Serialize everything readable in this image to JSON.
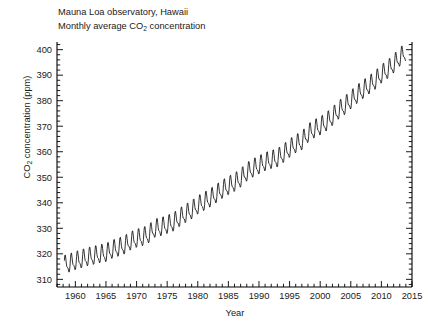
{
  "chart_data": {
    "type": "line",
    "title": "Mauna Loa observatory, Hawaii",
    "subtitle": "Monthly average CO2 concentration",
    "title_lines": [
      "Mauna Loa observatory, Hawaii",
      "Monthly average CO",
      " concentration"
    ],
    "xlabel": "Year",
    "ylabel": "CO2 concentration (ppm)",
    "ylabel_prefix": "CO",
    "ylabel_sub": "2",
    "ylabel_suffix": " concentration (ppm)",
    "xlim": [
      1957.0,
      2015.0
    ],
    "ylim": [
      307.0,
      403.0
    ],
    "xticks": [
      1960,
      1965,
      1970,
      1975,
      1980,
      1985,
      1990,
      1995,
      2000,
      2005,
      2010,
      2015
    ],
    "xtick_labels": [
      "1960",
      "1965",
      "1970",
      "1975",
      "1980",
      "1985",
      "1990",
      "1995",
      "2000",
      "2005",
      "2010",
      "2015"
    ],
    "x_minor_step": 1,
    "yticks": [
      310,
      320,
      330,
      340,
      350,
      360,
      370,
      380,
      390,
      400
    ],
    "ytick_labels": [
      "310",
      "320",
      "330",
      "340",
      "350",
      "360",
      "370",
      "380",
      "390",
      "400"
    ],
    "y_minor_step": 2,
    "grid": false,
    "legend": null,
    "line_color": "#000000",
    "line_width": 0.8,
    "spines": [
      "left",
      "bottom",
      "right"
    ],
    "tick_direction": "in",
    "series_name": "Monthly average CO2 concentration",
    "series_units": "ppm",
    "data_start_year": 1958.2,
    "data_end_year": 2014.0,
    "seasonal_amplitude_ppm": 3.1,
    "annual_values": [
      {
        "year": 1958,
        "value": 315.3
      },
      {
        "year": 1959,
        "value": 315.97
      },
      {
        "year": 1960,
        "value": 316.91
      },
      {
        "year": 1961,
        "value": 317.64
      },
      {
        "year": 1962,
        "value": 318.45
      },
      {
        "year": 1963,
        "value": 318.99
      },
      {
        "year": 1964,
        "value": 319.62
      },
      {
        "year": 1965,
        "value": 320.04
      },
      {
        "year": 1966,
        "value": 321.37
      },
      {
        "year": 1967,
        "value": 322.18
      },
      {
        "year": 1968,
        "value": 323.05
      },
      {
        "year": 1969,
        "value": 324.62
      },
      {
        "year": 1970,
        "value": 325.68
      },
      {
        "year": 1971,
        "value": 326.32
      },
      {
        "year": 1972,
        "value": 327.46
      },
      {
        "year": 1973,
        "value": 329.68
      },
      {
        "year": 1974,
        "value": 330.19
      },
      {
        "year": 1975,
        "value": 331.12
      },
      {
        "year": 1976,
        "value": 332.03
      },
      {
        "year": 1977,
        "value": 333.84
      },
      {
        "year": 1978,
        "value": 335.41
      },
      {
        "year": 1979,
        "value": 336.84
      },
      {
        "year": 1980,
        "value": 338.76
      },
      {
        "year": 1981,
        "value": 340.12
      },
      {
        "year": 1982,
        "value": 341.48
      },
      {
        "year": 1983,
        "value": 343.15
      },
      {
        "year": 1984,
        "value": 344.87
      },
      {
        "year": 1985,
        "value": 346.35
      },
      {
        "year": 1986,
        "value": 347.61
      },
      {
        "year": 1987,
        "value": 349.31
      },
      {
        "year": 1988,
        "value": 351.69
      },
      {
        "year": 1989,
        "value": 353.2
      },
      {
        "year": 1990,
        "value": 354.45
      },
      {
        "year": 1991,
        "value": 355.7
      },
      {
        "year": 1992,
        "value": 356.54
      },
      {
        "year": 1993,
        "value": 357.21
      },
      {
        "year": 1994,
        "value": 358.96
      },
      {
        "year": 1995,
        "value": 360.97
      },
      {
        "year": 1996,
        "value": 362.74
      },
      {
        "year": 1997,
        "value": 363.88
      },
      {
        "year": 1998,
        "value": 366.84
      },
      {
        "year": 1999,
        "value": 368.54
      },
      {
        "year": 2000,
        "value": 369.71
      },
      {
        "year": 2001,
        "value": 371.32
      },
      {
        "year": 2002,
        "value": 373.45
      },
      {
        "year": 2003,
        "value": 375.98
      },
      {
        "year": 2004,
        "value": 377.7
      },
      {
        "year": 2005,
        "value": 379.98
      },
      {
        "year": 2006,
        "value": 382.09
      },
      {
        "year": 2007,
        "value": 384.02
      },
      {
        "year": 2008,
        "value": 385.83
      },
      {
        "year": 2009,
        "value": 387.64
      },
      {
        "year": 2010,
        "value": 390.1
      },
      {
        "year": 2011,
        "value": 391.85
      },
      {
        "year": 2012,
        "value": 394.06
      },
      {
        "year": 2013,
        "value": 396.74
      },
      {
        "year": 2014,
        "value": 398.81
      }
    ]
  },
  "figure": {
    "background": "#ffffff",
    "plot_left_px": 57,
    "plot_right_px": 412,
    "plot_top_px": 42,
    "plot_bottom_px": 287
  }
}
